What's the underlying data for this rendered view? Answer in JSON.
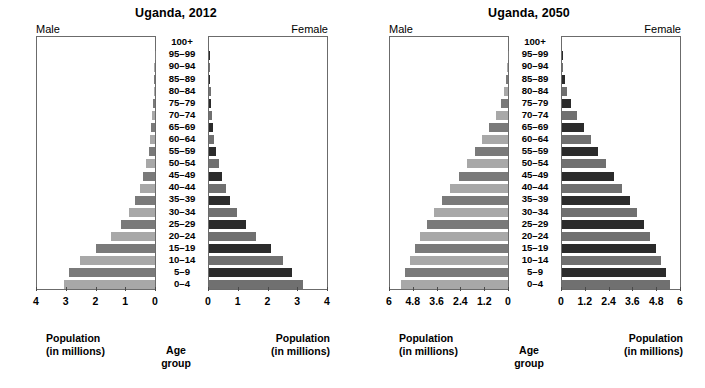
{
  "chart_data": [
    {
      "type": "bar",
      "id": "uganda-2012",
      "title": "Uganda, 2012",
      "subtype": "population-pyramid",
      "left_label": "Male",
      "right_label": "Female",
      "xlabel": "Population (in millions)",
      "xlabel_line1": "Population",
      "xlabel_line2": "(in millions)",
      "center_label_line1": "Age",
      "center_label_line2": "group",
      "ylabel": "Age group",
      "grid": false,
      "legend": "none",
      "xlim": [
        0,
        4
      ],
      "xticks": [
        0,
        1,
        2,
        3,
        4
      ],
      "xticklabels": [
        "0",
        "1",
        "2",
        "3",
        "4"
      ],
      "categories": [
        "100+",
        "95–99",
        "90–94",
        "85–89",
        "80–84",
        "75–79",
        "70–74",
        "65–69",
        "60–64",
        "55–59",
        "50–54",
        "45–49",
        "40–44",
        "35–39",
        "30–34",
        "25–29",
        "20–24",
        "15–19",
        "10–14",
        "5–9",
        "0–4"
      ],
      "series": [
        {
          "name": "Male",
          "side": "left",
          "values": [
            0.0,
            0.01,
            0.02,
            0.03,
            0.05,
            0.07,
            0.09,
            0.12,
            0.16,
            0.22,
            0.3,
            0.4,
            0.52,
            0.68,
            0.88,
            1.15,
            1.5,
            2.0,
            2.55,
            2.9,
            3.1
          ]
        },
        {
          "name": "Female",
          "side": "right",
          "values": [
            0.0,
            0.01,
            0.02,
            0.04,
            0.06,
            0.08,
            0.11,
            0.14,
            0.18,
            0.25,
            0.33,
            0.44,
            0.56,
            0.72,
            0.95,
            1.25,
            1.58,
            2.1,
            2.5,
            2.8,
            3.2
          ]
        }
      ]
    },
    {
      "type": "bar",
      "id": "uganda-2050",
      "title": "Uganda, 2050",
      "subtype": "population-pyramid",
      "left_label": "Male",
      "right_label": "Female",
      "xlabel": "Population (in millions)",
      "xlabel_line1": "Population",
      "xlabel_line2": "(in millions)",
      "center_label_line1": "Age",
      "center_label_line2": "group",
      "ylabel": "Age group",
      "grid": false,
      "legend": "none",
      "xlim": [
        0,
        6
      ],
      "xticks": [
        0,
        1.2,
        2.4,
        3.6,
        4.8,
        6
      ],
      "xticklabels": [
        "0",
        "1.2",
        "2.4",
        "3.6",
        "4.8",
        "6"
      ],
      "categories": [
        "100+",
        "95–99",
        "90–94",
        "85–89",
        "80–84",
        "75–79",
        "70–74",
        "65–69",
        "60–64",
        "55–59",
        "50–54",
        "45–49",
        "40–44",
        "35–39",
        "30–34",
        "25–29",
        "20–24",
        "15–19",
        "10–14",
        "5–9",
        "0–4"
      ],
      "series": [
        {
          "name": "Male",
          "side": "left",
          "values": [
            0.0,
            0.02,
            0.05,
            0.1,
            0.2,
            0.38,
            0.62,
            0.95,
            1.3,
            1.7,
            2.1,
            2.5,
            2.95,
            3.35,
            3.75,
            4.1,
            4.45,
            4.75,
            5.0,
            5.25,
            5.45
          ]
        },
        {
          "name": "Female",
          "side": "right",
          "values": [
            0.0,
            0.03,
            0.07,
            0.14,
            0.27,
            0.48,
            0.75,
            1.1,
            1.45,
            1.85,
            2.25,
            2.65,
            3.05,
            3.45,
            3.8,
            4.15,
            4.48,
            4.78,
            5.05,
            5.28,
            5.5
          ]
        }
      ]
    }
  ],
  "colors": {
    "male_dark": "#7a7a7a",
    "male_light": "#a8a8a8",
    "female_dark": "#2b2b2b",
    "female_light": "#707070",
    "frame": "#6b6b6b",
    "text": "#000000",
    "background": "#ffffff"
  }
}
